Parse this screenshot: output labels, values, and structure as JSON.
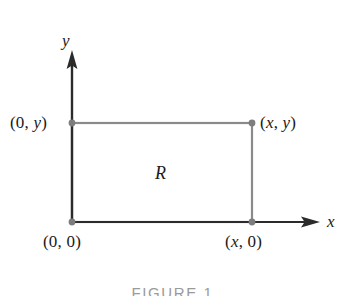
{
  "figure": {
    "caption": "FIGURE 1",
    "region_label": "R",
    "axes": {
      "x_label": "x",
      "y_label": "y",
      "x_axis_icon": "arrow-right-icon",
      "y_axis_icon": "arrow-up-icon"
    },
    "points": [
      {
        "id": "top-left",
        "label_prefix": "(0, ",
        "label_var": "y",
        "label_suffix": ")",
        "full": "(0, y)"
      },
      {
        "id": "top-right",
        "label_prefix": "(",
        "label_var": "x",
        "label_mid": ", ",
        "label_var2": "y",
        "label_suffix": ")",
        "full": "(x, y)"
      },
      {
        "id": "bottom-left",
        "label_prefix": "(0, 0)",
        "full": "(0, 0)"
      },
      {
        "id": "bottom-right",
        "label_prefix": "(",
        "label_var": "x",
        "label_suffix": ", 0)",
        "full": "(x, 0)"
      }
    ],
    "label_text": {
      "pt_0y_open": "(0, ",
      "pt_0y_var": "y",
      "pt_0y_close": ")",
      "pt_xy_open": "(",
      "pt_xy_var1": "x",
      "pt_xy_mid": ", ",
      "pt_xy_var2": "y",
      "pt_xy_close": ")",
      "pt_00": "(0, 0)",
      "pt_x0_open": "(",
      "pt_x0_var": "x",
      "pt_x0_close": ", 0)"
    },
    "colors": {
      "background": "#ffffff",
      "axis": "#2b2b2b",
      "rectangle_stroke": "#8a8a8a",
      "point_marker": "#7d7d7d",
      "text": "#1a1a1a",
      "caption": "#9a9a9a"
    },
    "geometry": {
      "origin_x": 72,
      "origin_y": 222,
      "rect_right_x": 252,
      "rect_top_y": 123,
      "y_axis_top": 55,
      "x_axis_right": 318,
      "marker_radius": 3.4
    }
  }
}
